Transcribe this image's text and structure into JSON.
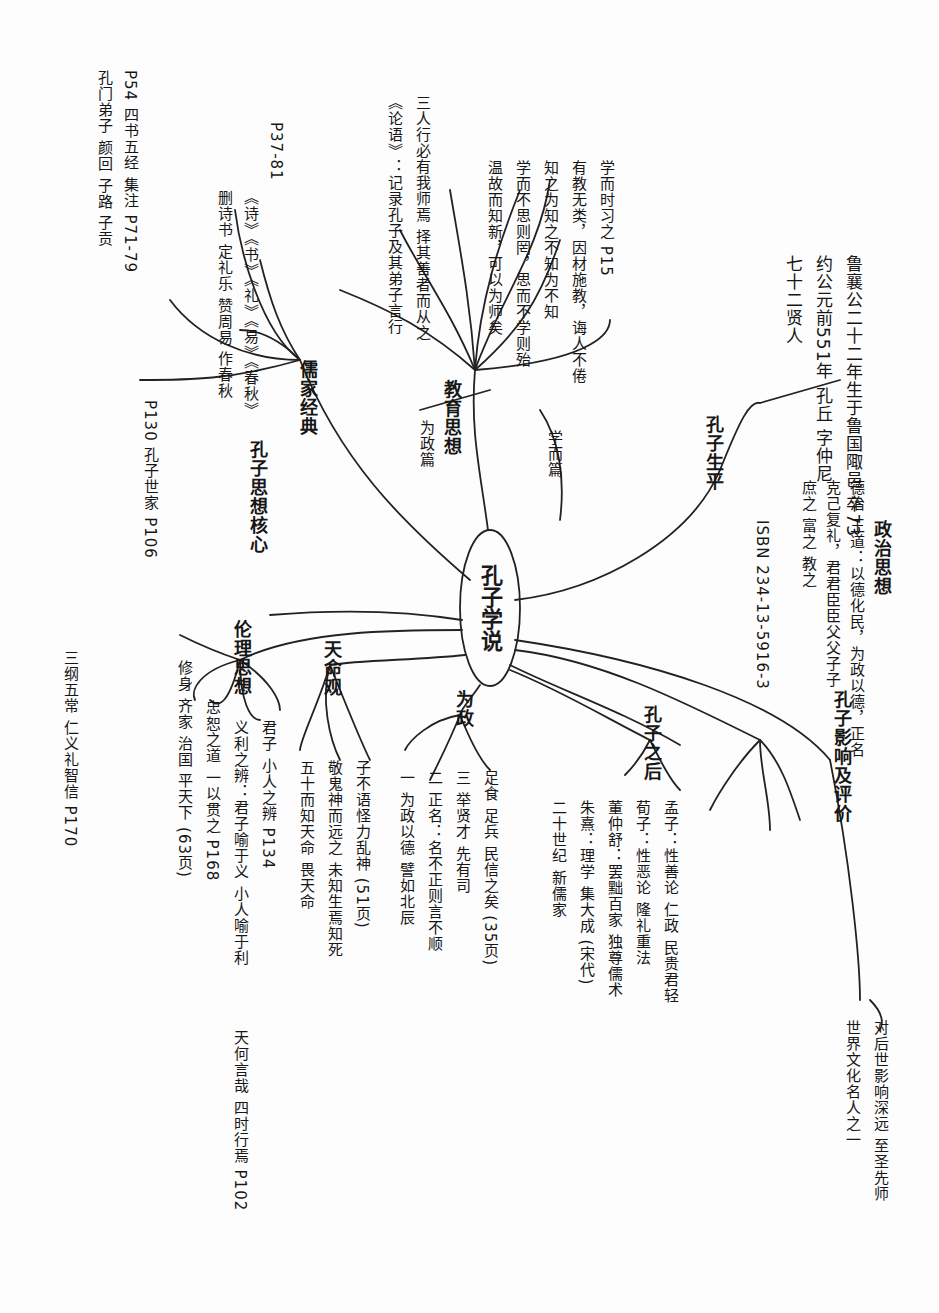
{
  "document": {
    "type": "handwritten mind map (rotated 90°)",
    "central_node": "孔子学说",
    "branches": [
      {
        "id": "top-right",
        "label": "孔子生平",
        "notes": [
          "鲁襄公二十二年生于鲁国陬邑 卒73",
          "约公元前551年 孔丘 字仲尼",
          "七十二贤人"
        ]
      },
      {
        "id": "right-1",
        "label": "政治思想",
        "notes": [
          "德治 王道：以德化民，为政以德，正名",
          "克己复礼，君君臣臣父父子子",
          "庶之 富之 教之",
          "ISBN 234-13-5916-3"
        ]
      },
      {
        "id": "top-center",
        "label": "教育思想",
        "notes": [
          "学而时习之 P15",
          "有教无类，因材施教，诲人不倦",
          "知之为知之不知为不知",
          "学而不思则罔，思而不学则殆",
          "温故而知新，可以为师矣",
          "三人行必有我师焉 择其善者而从之",
          "《论语》：记录孔子及其弟子言行"
        ],
        "sub": [
          {
            "label": "学而篇",
            "note": "学习与修身"
          },
          {
            "label": "为政篇",
            "note": "以德治国"
          }
        ]
      },
      {
        "id": "left-top",
        "label": "儒家经典",
        "ref": "P37-81",
        "notes": [
          "《诗》《书》《礼》《易》《春秋》",
          "删诗书 定礼乐 赞周易 作春秋",
          "P54 四书五经 集注 P71-79",
          "孔门弟子 颜回 子路 子贡",
          "P130 孔子世家 P106"
        ]
      },
      {
        "id": "left-mid",
        "label": "孔子思想核心",
        "notes": [
          "仁：爱人 己所不欲勿施于人",
          "礼：克己复礼为仁",
          "中庸：过犹不及",
          "孝悌：仁之本"
        ]
      },
      {
        "id": "bottom-left",
        "label": "伦理思想",
        "notes": [
          "君子 小人之辨 P134",
          "义利之辨：君子喻于义 小人喻于利",
          "忠恕之道 一以贯之 P168",
          "修身 齐家 治国 平天下 (63页)",
          "三纲五常 仁义礼智信 P170"
        ]
      },
      {
        "id": "bottom-mid",
        "label": "天命观",
        "notes": [
          "五十而知天命 畏天命",
          "敬鬼神而远之 未知生焉知死",
          "子不语怪力乱神 (51页)",
          "天何言哉 四时行焉 P102"
        ]
      },
      {
        "id": "bottom-center",
        "label": "为政",
        "notes": [
          "一 为政以德 譬如北辰",
          "二 正名：名不正则言不顺",
          "三 举贤才 先有司",
          "足食 足兵 民信之矣 (35页)"
        ]
      },
      {
        "id": "bottom-right",
        "label": "孔子之后",
        "notes": [
          "孟子：性善论 仁政 民贵君轻",
          "荀子：性恶论 隆礼重法",
          "董仲舒：罢黜百家 独尊儒术",
          "朱熹：理学 集大成 (宋代)",
          "二十世纪 新儒家"
        ]
      },
      {
        "id": "far-right",
        "label": "孔子影响及评价",
        "notes": [
          "对后世影响深远 至圣先师",
          "世界文化名人之一"
        ]
      }
    ]
  }
}
